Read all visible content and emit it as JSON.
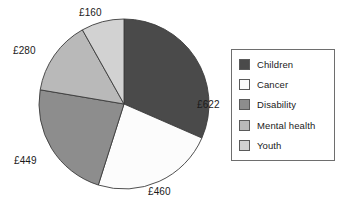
{
  "chart_data": {
    "type": "pie",
    "title": "",
    "currency_symbol": "£",
    "total": 1971,
    "start_angle_deg": 0,
    "direction": "clockwise",
    "center": {
      "x": 124,
      "y": 104
    },
    "radius": 85,
    "legend_position": "right",
    "categories": [
      "Children",
      "Cancer",
      "Disability",
      "Mental health",
      "Youth"
    ],
    "values": [
      622,
      460,
      449,
      280,
      160
    ],
    "labels": [
      "£622",
      "£460",
      "£449",
      "£280",
      "£160"
    ],
    "colors": [
      "#4a4a4a",
      "#fcfcfc",
      "#8d8d8d",
      "#b9b9b9",
      "#d2d2d2"
    ],
    "slices": [
      {
        "name": "Children",
        "value": 622,
        "label": "£622",
        "color": "#4a4a4a",
        "start_deg": 0,
        "end_deg": 113.6,
        "label_pos": {
          "left": 197,
          "top": 99
        }
      },
      {
        "name": "Cancer",
        "value": 460,
        "label": "£460",
        "color": "#fcfcfc",
        "start_deg": 113.6,
        "end_deg": 197.6,
        "label_pos": {
          "left": 148,
          "top": 186
        }
      },
      {
        "name": "Disability",
        "value": 449,
        "label": "£449",
        "color": "#8d8d8d",
        "start_deg": 197.6,
        "end_deg": 279.6,
        "label_pos": {
          "left": 14,
          "top": 155
        }
      },
      {
        "name": "Mental health",
        "value": 280,
        "label": "£280",
        "color": "#b9b9b9",
        "start_deg": 279.6,
        "end_deg": 330.7,
        "label_pos": {
          "left": 13,
          "top": 45
        }
      },
      {
        "name": "Youth",
        "value": 160,
        "label": "£160",
        "color": "#d2d2d2",
        "start_deg": 330.7,
        "end_deg": 360,
        "label_pos": {
          "left": 79,
          "top": 7
        }
      }
    ]
  },
  "legend": {
    "items": [
      {
        "label": "Children",
        "color": "#4a4a4a"
      },
      {
        "label": "Cancer",
        "color": "#fcfcfc"
      },
      {
        "label": "Disability",
        "color": "#8d8d8d"
      },
      {
        "label": "Mental health",
        "color": "#b9b9b9"
      },
      {
        "label": "Youth",
        "color": "#d2d2d2"
      }
    ]
  }
}
